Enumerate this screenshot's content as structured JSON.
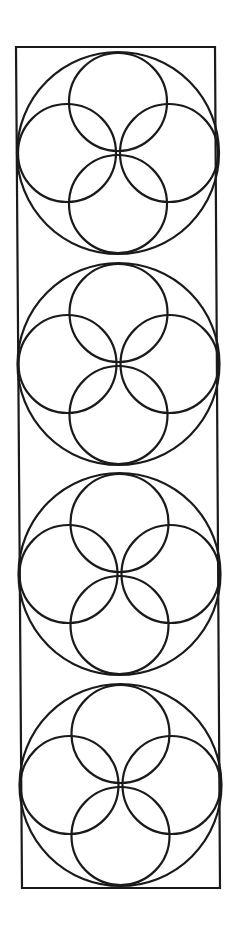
{
  "diagram": {
    "stroke_color": "#1a1a1a",
    "background": "#ffffff",
    "frame": {
      "points": [
        [
          16,
          47
        ],
        [
          215,
          47
        ],
        [
          220,
          888
        ],
        [
          22,
          888
        ]
      ]
    },
    "units": [
      {
        "cx": 118,
        "cy": 153,
        "R": 101,
        "r": 49,
        "offset": 51
      },
      {
        "cx": 118.5,
        "cy": 364,
        "R": 101,
        "r": 49,
        "offset": 51
      },
      {
        "cx": 119.5,
        "cy": 574,
        "R": 101,
        "r": 49,
        "offset": 51
      },
      {
        "cx": 120.5,
        "cy": 785,
        "R": 101,
        "r": 49,
        "offset": 51
      }
    ]
  }
}
